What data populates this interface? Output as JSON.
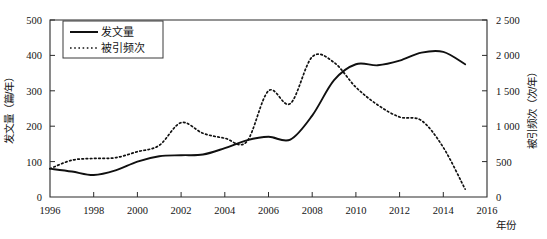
{
  "chart_data": {
    "type": "line",
    "title": "",
    "xlabel": "年份",
    "x": [
      1996,
      1997,
      1998,
      1999,
      2000,
      2001,
      2002,
      2003,
      2004,
      2005,
      2006,
      2007,
      2008,
      2009,
      2010,
      2011,
      2012,
      2013,
      2014,
      2015
    ],
    "xlim": [
      1996,
      2016
    ],
    "xticks": [
      1996,
      1998,
      2000,
      2002,
      2004,
      2006,
      2008,
      2010,
      2012,
      2014,
      2016
    ],
    "xticklabels": [
      "1996",
      "1998",
      "2000",
      "2002",
      "2004",
      "2006",
      "2008",
      "2010",
      "2012",
      "2014",
      "2016"
    ],
    "grid": false,
    "legend_position": "top-left",
    "axes": [
      {
        "id": "left",
        "label": "发文量（篇/年）",
        "lim": [
          0,
          500
        ],
        "ticks": [
          0,
          100,
          200,
          300,
          400,
          500
        ],
        "ticklabels": [
          "0",
          "100",
          "200",
          "300",
          "400",
          "500"
        ]
      },
      {
        "id": "right",
        "label": "被引频次（次/年）",
        "lim": [
          0,
          2500
        ],
        "ticks": [
          0,
          500,
          1000,
          1500,
          2000,
          2500
        ],
        "ticklabels": [
          "0",
          "500",
          "1 000",
          "1 500",
          "2 000",
          "2 500"
        ]
      }
    ],
    "series": [
      {
        "name": "发文量",
        "axis": "left",
        "style": "solid",
        "unit": "篇/年",
        "values": [
          80,
          72,
          62,
          75,
          100,
          115,
          118,
          120,
          138,
          160,
          170,
          162,
          230,
          330,
          375,
          372,
          385,
          408,
          410,
          375
        ]
      },
      {
        "name": "被引频次",
        "axis": "right",
        "style": "dotted",
        "unit": "次/年",
        "values": [
          400,
          520,
          545,
          555,
          640,
          730,
          1050,
          900,
          830,
          780,
          1500,
          1320,
          1980,
          1900,
          1550,
          1300,
          1130,
          1080,
          700,
          110
        ]
      }
    ],
    "legend": [
      {
        "name": "发文量",
        "style": "solid"
      },
      {
        "name": "被引频次",
        "style": "dotted"
      }
    ]
  }
}
